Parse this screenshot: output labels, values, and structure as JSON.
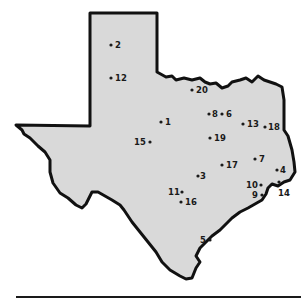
{
  "map": {
    "region": "Texas",
    "fill_color": "#d9d9d9",
    "border_color": "#111111",
    "outline_points": "93,13 157,13 157,72 166,77 172,76 176,80 184,78 192,80 200,78 205,82 210,84 216,83 222,88 228,86 232,82 240,80 246,78 252,82 258,76 264,80 270,82 276,84 282,87 284,100 284,130 288,136 292,150 294,162 295,172 290,180 284,182 278,186 272,184 268,188 266,194 262,200 255,204 248,208 240,212 232,218 226,224 220,230 212,236 206,242 200,248 196,256 200,262 196,268 192,278 186,279 180,276 170,270 162,262 156,252 148,242 140,232 132,222 124,210 120,205 112,200 98,192 92,192 86,204 82,208 76,205 68,198 60,193 53,183 50,172 50,160 45,152 38,146 30,138 24,134 22,130 16,125 90,126 90,13"
  },
  "points": [
    {
      "id": "2",
      "x": 111,
      "y": 45,
      "label_dx": 4,
      "label_dy": 3
    },
    {
      "id": "12",
      "x": 111,
      "y": 78,
      "label_dx": 4,
      "label_dy": 3
    },
    {
      "id": "20",
      "x": 192,
      "y": 90,
      "label_dx": 4,
      "label_dy": 3
    },
    {
      "id": "1",
      "x": 161,
      "y": 122,
      "label_dx": 4,
      "label_dy": 3
    },
    {
      "id": "15",
      "x": 150,
      "y": 142,
      "label_dx": -16,
      "label_dy": 3
    },
    {
      "id": "8",
      "x": 209,
      "y": 114,
      "label_dx": 3,
      "label_dy": 3
    },
    {
      "id": "6",
      "x": 222,
      "y": 114,
      "label_dx": 4,
      "label_dy": 3
    },
    {
      "id": "19",
      "x": 210,
      "y": 138,
      "label_dx": 4,
      "label_dy": 3
    },
    {
      "id": "13",
      "x": 243,
      "y": 124,
      "label_dx": 4,
      "label_dy": 3
    },
    {
      "id": "18",
      "x": 265,
      "y": 127,
      "label_dx": 3,
      "label_dy": 3
    },
    {
      "id": "17",
      "x": 222,
      "y": 165,
      "label_dx": 4,
      "label_dy": 3
    },
    {
      "id": "7",
      "x": 255,
      "y": 159,
      "label_dx": 4,
      "label_dy": 3
    },
    {
      "id": "3",
      "x": 198,
      "y": 176,
      "label_dx": 2,
      "label_dy": 3
    },
    {
      "id": "4",
      "x": 277,
      "y": 170,
      "label_dx": 3,
      "label_dy": 3
    },
    {
      "id": "10",
      "x": 261,
      "y": 185,
      "label_dx": -15,
      "label_dy": 3
    },
    {
      "id": "9",
      "x": 262,
      "y": 195,
      "label_dx": -10,
      "label_dy": 3
    },
    {
      "id": "14",
      "x": 279,
      "y": 182,
      "label_dx": -1,
      "label_dy": 14
    },
    {
      "id": "11",
      "x": 182,
      "y": 192,
      "label_dx": -14,
      "label_dy": 3
    },
    {
      "id": "16",
      "x": 181,
      "y": 202,
      "label_dx": 4,
      "label_dy": 3
    },
    {
      "id": "5",
      "x": 210,
      "y": 240,
      "label_dx": -10,
      "label_dy": 3
    }
  ]
}
